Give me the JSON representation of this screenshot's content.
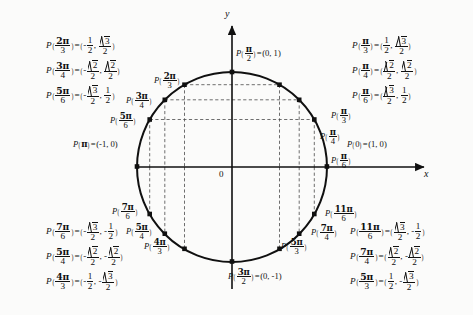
{
  "figure": {
    "axes": {
      "x_label": "x",
      "y_label": "y",
      "origin_label": "0"
    },
    "circle": {
      "center_x": 232,
      "center_y": 167,
      "radius": 95
    }
  },
  "chart_data": {
    "type": "scatter",
    "xlabel": "x",
    "ylabel": "y",
    "xlim": [
      -1,
      1
    ],
    "ylim": [
      -1,
      1
    ],
    "grid": "dashed-guides",
    "legend": "none",
    "points": [
      {
        "angle": "0",
        "num": 0,
        "den": 1,
        "x": 1,
        "y": 0,
        "deg": 0
      },
      {
        "angle": "pi/6",
        "num": 1,
        "den": 6,
        "x": 0.866,
        "y": 0.5,
        "deg": 30
      },
      {
        "angle": "pi/4",
        "num": 1,
        "den": 4,
        "x": 0.7071,
        "y": 0.7071,
        "deg": 45
      },
      {
        "angle": "pi/3",
        "num": 1,
        "den": 3,
        "x": 0.5,
        "y": 0.866,
        "deg": 60
      },
      {
        "angle": "pi/2",
        "num": 1,
        "den": 2,
        "x": 0,
        "y": 1,
        "deg": 90
      },
      {
        "angle": "2pi/3",
        "num": 2,
        "den": 3,
        "x": -0.5,
        "y": 0.866,
        "deg": 120
      },
      {
        "angle": "3pi/4",
        "num": 3,
        "den": 4,
        "x": -0.7071,
        "y": 0.7071,
        "deg": 135
      },
      {
        "angle": "5pi/6",
        "num": 5,
        "den": 6,
        "x": -0.866,
        "y": 0.5,
        "deg": 150
      },
      {
        "angle": "pi",
        "num": 1,
        "den": 1,
        "x": -1,
        "y": 0,
        "deg": 180
      },
      {
        "angle": "7pi/6",
        "num": 7,
        "den": 6,
        "x": -0.866,
        "y": -0.5,
        "deg": 210
      },
      {
        "angle": "5pi/4",
        "num": 5,
        "den": 4,
        "x": -0.7071,
        "y": -0.7071,
        "deg": 225
      },
      {
        "angle": "4pi/3",
        "num": 4,
        "den": 3,
        "x": -0.5,
        "y": -0.866,
        "deg": 240
      },
      {
        "angle": "3pi/2",
        "num": 3,
        "den": 2,
        "x": 0,
        "y": -1,
        "deg": 270
      },
      {
        "angle": "5pi/3",
        "num": 5,
        "den": 3,
        "x": 0.5,
        "y": -0.866,
        "deg": 300
      },
      {
        "angle": "7pi/4",
        "num": 7,
        "den": 4,
        "x": 0.7071,
        "y": -0.7071,
        "deg": 315
      },
      {
        "angle": "11pi/6",
        "num": 11,
        "den": 6,
        "x": 0.866,
        "y": -0.5,
        "deg": 330
      }
    ]
  },
  "axis_point_labels": {
    "right": {
      "p": "P",
      "arg_num": "0",
      "eq": "=",
      "coords": "(1, 0)"
    },
    "left": {
      "p": "P",
      "arg_pi": "π",
      "eq": "=",
      "coords": "(-1, 0)"
    },
    "top": {
      "p": "P",
      "num": "π",
      "den": "2",
      "eq": "=",
      "coords": "(0, 1)"
    },
    "bottom": {
      "p": "P",
      "num": "3π",
      "den": "2",
      "eq": "=",
      "coords": "(0, -1)"
    }
  },
  "arc_labels": [
    {
      "name": "pi-over-6",
      "num": "π",
      "den": "6"
    },
    {
      "name": "pi-over-4",
      "num": "π",
      "den": "4"
    },
    {
      "name": "pi-over-3",
      "num": "π",
      "den": "3"
    },
    {
      "name": "2pi-over-3",
      "num": "2π",
      "den": "3"
    },
    {
      "name": "3pi-over-4",
      "num": "3π",
      "den": "4"
    },
    {
      "name": "5pi-over-6",
      "num": "5π",
      "den": "6"
    },
    {
      "name": "7pi-over-6",
      "num": "7π",
      "den": "6"
    },
    {
      "name": "5pi-over-4",
      "num": "5π",
      "den": "4"
    },
    {
      "name": "4pi-over-3",
      "num": "4π",
      "den": "3"
    },
    {
      "name": "5pi-over-3",
      "num": "5π",
      "den": "3"
    },
    {
      "name": "7pi-over-4",
      "num": "7π",
      "den": "4"
    },
    {
      "name": "11pi-over-6",
      "num": "11π",
      "den": "6"
    }
  ],
  "blocks": {
    "top_left": [
      {
        "arg_num": "2π",
        "arg_den": "3",
        "x": {
          "sign": "-",
          "num": "1",
          "den": "2",
          "radicand": ""
        },
        "y": {
          "sign": "",
          "num": "√3",
          "den": "2",
          "radicand": "3"
        }
      },
      {
        "arg_num": "3π",
        "arg_den": "4",
        "x": {
          "sign": "-",
          "num": "√2",
          "den": "2",
          "radicand": "2"
        },
        "y": {
          "sign": "",
          "num": "√2",
          "den": "2",
          "radicand": "2"
        }
      },
      {
        "arg_num": "5π",
        "arg_den": "6",
        "x": {
          "sign": "-",
          "num": "√3",
          "den": "2",
          "radicand": "3"
        },
        "y": {
          "sign": "",
          "num": "1",
          "den": "2",
          "radicand": ""
        }
      }
    ],
    "top_right": [
      {
        "arg_num": "π",
        "arg_den": "3",
        "x": {
          "sign": "",
          "num": "1",
          "den": "2",
          "radicand": ""
        },
        "y": {
          "sign": "",
          "num": "√3",
          "den": "2",
          "radicand": "3"
        }
      },
      {
        "arg_num": "π",
        "arg_den": "4",
        "x": {
          "sign": "",
          "num": "√2",
          "den": "2",
          "radicand": "2"
        },
        "y": {
          "sign": "",
          "num": "√2",
          "den": "2",
          "radicand": "2"
        }
      },
      {
        "arg_num": "π",
        "arg_den": "6",
        "x": {
          "sign": "",
          "num": "√3",
          "den": "2",
          "radicand": "3"
        },
        "y": {
          "sign": "",
          "num": "1",
          "den": "2",
          "radicand": ""
        }
      }
    ],
    "bottom_left": [
      {
        "arg_num": "7π",
        "arg_den": "6",
        "x": {
          "sign": "-",
          "num": "√3",
          "den": "2",
          "radicand": "3"
        },
        "y": {
          "sign": "-",
          "num": "1",
          "den": "2",
          "radicand": ""
        }
      },
      {
        "arg_num": "5π",
        "arg_den": "4",
        "x": {
          "sign": "-",
          "num": "√2",
          "den": "2",
          "radicand": "2"
        },
        "y": {
          "sign": "-",
          "num": "√2",
          "den": "2",
          "radicand": "2"
        }
      },
      {
        "arg_num": "4π",
        "arg_den": "3",
        "x": {
          "sign": "-",
          "num": "1",
          "den": "2",
          "radicand": ""
        },
        "y": {
          "sign": "-",
          "num": "√3",
          "den": "2",
          "radicand": "3"
        }
      }
    ],
    "bottom_right": [
      {
        "arg_num": "11π",
        "arg_den": "6",
        "x": {
          "sign": "",
          "num": "√3",
          "den": "2",
          "radicand": "3"
        },
        "y": {
          "sign": "-",
          "num": "1",
          "den": "2",
          "radicand": ""
        }
      },
      {
        "arg_num": "7π",
        "arg_den": "4",
        "x": {
          "sign": "",
          "num": "√2",
          "den": "2",
          "radicand": "2"
        },
        "y": {
          "sign": "-",
          "num": "√2",
          "den": "2",
          "radicand": "2"
        }
      },
      {
        "arg_num": "5π",
        "arg_den": "3",
        "x": {
          "sign": "",
          "num": "1",
          "den": "2",
          "radicand": ""
        },
        "y": {
          "sign": "-",
          "num": "√3",
          "den": "2",
          "radicand": "3"
        }
      }
    ]
  },
  "symbols": {
    "P": "P",
    "equals": "=",
    "comma": ",",
    "lparen": "(",
    "rparen": ")"
  }
}
